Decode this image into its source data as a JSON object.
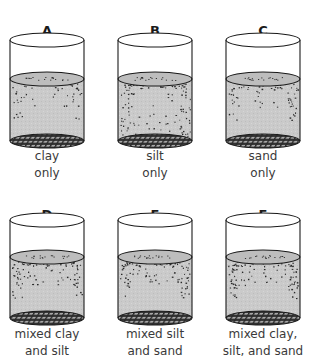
{
  "colors": {
    "outline": "#1a1a1a",
    "water": "#c8c8c8",
    "water_surface": "#bdbdbd",
    "speckle": "#2a2a2a",
    "mesh_bg": "#2a2a2a",
    "mesh_line": "#9a9a9a",
    "text": "#3a3a3a"
  },
  "cylinders": [
    {
      "letter": "A",
      "line1": "clay",
      "line2": "only",
      "cx": 47,
      "row": 0,
      "pattern": "light"
    },
    {
      "letter": "B",
      "line1": "silt",
      "line2": "only",
      "cx": 155,
      "row": 0,
      "pattern": "dense"
    },
    {
      "letter": "C",
      "line1": "sand",
      "line2": "only",
      "cx": 263,
      "row": 0,
      "pattern": "medium"
    },
    {
      "letter": "D",
      "line1": "mixed clay",
      "line2": "and silt",
      "cx": 47,
      "row": 1,
      "pattern": "clay-silt"
    },
    {
      "letter": "E",
      "line1": "mixed silt",
      "line2": "and sand",
      "cx": 155,
      "row": 1,
      "pattern": "silt-sand"
    },
    {
      "letter": "F",
      "line1": "mixed clay,",
      "line2": "silt, and sand",
      "cx": 263,
      "row": 1,
      "pattern": "all"
    }
  ]
}
